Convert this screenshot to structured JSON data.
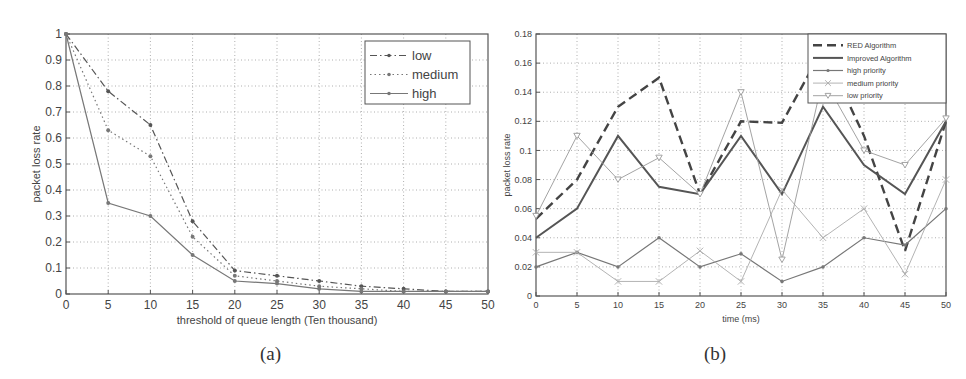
{
  "chart_data": [
    {
      "id": "a",
      "type": "line",
      "caption": "(a)",
      "title": "",
      "xlabel": "threshold of queue length (Ten thousand)",
      "ylabel": "packet loss rate",
      "xlim": [
        0,
        50
      ],
      "ylim": [
        0,
        1
      ],
      "xticks": [
        0,
        5,
        10,
        15,
        20,
        25,
        30,
        35,
        40,
        45,
        50
      ],
      "yticks": [
        0,
        0.1,
        0.2,
        0.3,
        0.4,
        0.5,
        0.6,
        0.7,
        0.8,
        0.9,
        1
      ],
      "grid": true,
      "legend_position": "upper right",
      "x": [
        0,
        5,
        10,
        15,
        20,
        25,
        30,
        35,
        40,
        45,
        50
      ],
      "series": [
        {
          "name": "low",
          "style": "dash-dot",
          "marker": "dot",
          "color": "#555555",
          "values": [
            1.0,
            0.78,
            0.65,
            0.28,
            0.09,
            0.07,
            0.05,
            0.03,
            0.02,
            0.01,
            0.01
          ]
        },
        {
          "name": "medium",
          "style": "dotted",
          "marker": "dot",
          "color": "#777777",
          "values": [
            1.0,
            0.63,
            0.53,
            0.22,
            0.07,
            0.05,
            0.03,
            0.02,
            0.01,
            0.01,
            0.01
          ]
        },
        {
          "name": "high",
          "style": "solid",
          "marker": "dot",
          "color": "#777777",
          "values": [
            1.0,
            0.35,
            0.3,
            0.15,
            0.05,
            0.04,
            0.02,
            0.01,
            0.01,
            0.01,
            0.01
          ]
        }
      ]
    },
    {
      "id": "b",
      "type": "line",
      "caption": "(b)",
      "title": "",
      "xlabel": "time (ms)",
      "ylabel": "packet loss rate",
      "xlim": [
        0,
        50
      ],
      "ylim": [
        0,
        0.18
      ],
      "xticks": [
        0,
        5,
        10,
        15,
        20,
        25,
        30,
        35,
        40,
        45,
        50
      ],
      "yticks": [
        0,
        0.02,
        0.04,
        0.06,
        0.08,
        0.1,
        0.12,
        0.14,
        0.16,
        0.18
      ],
      "grid": true,
      "legend_position": "upper right",
      "x": [
        0,
        5,
        10,
        15,
        20,
        25,
        30,
        35,
        40,
        45,
        50
      ],
      "series": [
        {
          "name": "RED Algorithm",
          "style": "dashed",
          "marker": "none",
          "color": "#444444",
          "values": [
            0.053,
            0.08,
            0.13,
            0.15,
            0.07,
            0.12,
            0.119,
            0.17,
            0.11,
            0.031,
            0.12
          ]
        },
        {
          "name": "Improved Algorithm",
          "style": "solid-thick",
          "marker": "none",
          "color": "#555555",
          "values": [
            0.04,
            0.06,
            0.11,
            0.075,
            0.07,
            0.11,
            0.07,
            0.13,
            0.09,
            0.07,
            0.12
          ]
        },
        {
          "name": "high priority",
          "style": "solid",
          "marker": "dot",
          "color": "#777777",
          "values": [
            0.02,
            0.03,
            0.02,
            0.04,
            0.02,
            0.029,
            0.01,
            0.02,
            0.04,
            0.035,
            0.06
          ]
        },
        {
          "name": "medium priority",
          "style": "solid-thin",
          "marker": "x",
          "color": "#aaaaaa",
          "values": [
            0.03,
            0.03,
            0.01,
            0.01,
            0.031,
            0.01,
            0.073,
            0.04,
            0.06,
            0.015,
            0.08
          ]
        },
        {
          "name": "low priority",
          "style": "solid-thin",
          "marker": "triangle-down",
          "color": "#999999",
          "values": [
            0.055,
            0.11,
            0.08,
            0.095,
            0.07,
            0.14,
            0.025,
            0.15,
            0.1,
            0.09,
            0.122
          ]
        }
      ]
    }
  ]
}
